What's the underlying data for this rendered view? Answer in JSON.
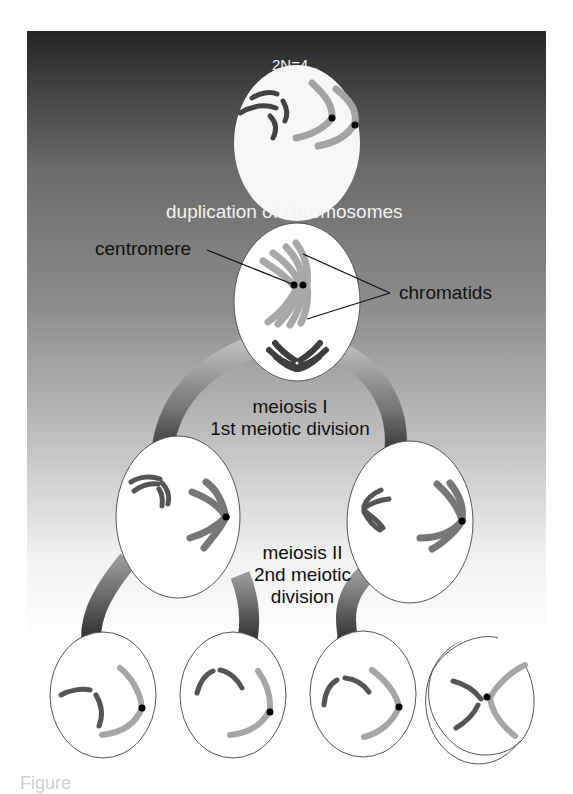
{
  "figure": {
    "title_hidden": "2N=4",
    "labels": {
      "duplication": "duplication of chromosomes",
      "centromere": "centromere",
      "chromatids": "chromatids",
      "meiosis1_line1": "meiosis I",
      "meiosis1_line2": "1st meiotic division",
      "meiosis2_line1": "meiosis II",
      "meiosis2_line2": "2nd meiotic",
      "meiosis2_line3": "division"
    },
    "caption_partial": "Figure",
    "colors": {
      "background_top": "#2a2a2a",
      "background_mid": "#8c8c8c",
      "background_bottom": "#ffffff",
      "cell_fill": "#ffffff",
      "cell_outline": "#444444",
      "chromosome_dark": "#555555",
      "chromosome_light": "#9a9a9a",
      "centromere": "#000000",
      "arrow_dark": "#222222",
      "arrow_light": "#aaaaaa"
    },
    "stages": [
      {
        "name": "parent-cell",
        "description": "2N=4 diploid cell"
      },
      {
        "name": "duplicated-cell",
        "description": "chromosomes duplicated into sister chromatids"
      },
      {
        "name": "meiosis-1-daughter-left"
      },
      {
        "name": "meiosis-1-daughter-right"
      },
      {
        "name": "gamete-1"
      },
      {
        "name": "gamete-2"
      },
      {
        "name": "gamete-3"
      },
      {
        "name": "gamete-4"
      }
    ]
  }
}
